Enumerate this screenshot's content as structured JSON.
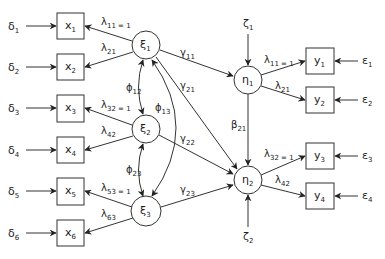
{
  "diagram": {
    "type": "structural-equation-model",
    "colors": {
      "stroke": "#333333",
      "text": "#222222",
      "background": "#ffffff"
    },
    "exogenous_indicators": [
      {
        "id": "x1",
        "label": "x",
        "sub": "1",
        "error": "δ",
        "error_sub": "1"
      },
      {
        "id": "x2",
        "label": "x",
        "sub": "2",
        "error": "δ",
        "error_sub": "2"
      },
      {
        "id": "x3",
        "label": "x",
        "sub": "3",
        "error": "δ",
        "error_sub": "3"
      },
      {
        "id": "x4",
        "label": "x",
        "sub": "4",
        "error": "δ",
        "error_sub": "4"
      },
      {
        "id": "x5",
        "label": "x",
        "sub": "5",
        "error": "δ",
        "error_sub": "5"
      },
      {
        "id": "x6",
        "label": "x",
        "sub": "6",
        "error": "δ",
        "error_sub": "6"
      }
    ],
    "exogenous_latents": [
      {
        "id": "xi1",
        "label": "ξ",
        "sub": "1"
      },
      {
        "id": "xi2",
        "label": "ξ",
        "sub": "2"
      },
      {
        "id": "xi3",
        "label": "ξ",
        "sub": "3"
      }
    ],
    "endogenous_latents": [
      {
        "id": "eta1",
        "label": "η",
        "sub": "1",
        "disturbance": "ζ",
        "disturbance_sub": "1"
      },
      {
        "id": "eta2",
        "label": "η",
        "sub": "2",
        "disturbance": "ζ",
        "disturbance_sub": "2"
      }
    ],
    "endogenous_indicators": [
      {
        "id": "y1",
        "label": "y",
        "sub": "1",
        "error": "ε",
        "error_sub": "1"
      },
      {
        "id": "y2",
        "label": "y",
        "sub": "2",
        "error": "ε",
        "error_sub": "2"
      },
      {
        "id": "y3",
        "label": "y",
        "sub": "3",
        "error": "ε",
        "error_sub": "3"
      },
      {
        "id": "y4",
        "label": "y",
        "sub": "4",
        "error": "ε",
        "error_sub": "4"
      }
    ],
    "x_loadings": [
      {
        "from": "xi1",
        "to": "x1",
        "label": "λ",
        "sub": "11 = 1"
      },
      {
        "from": "xi1",
        "to": "x2",
        "label": "λ",
        "sub": "21"
      },
      {
        "from": "xi2",
        "to": "x3",
        "label": "λ",
        "sub": "32 = 1"
      },
      {
        "from": "xi2",
        "to": "x4",
        "label": "λ",
        "sub": "42"
      },
      {
        "from": "xi3",
        "to": "x5",
        "label": "λ",
        "sub": "53 = 1"
      },
      {
        "from": "xi3",
        "to": "x6",
        "label": "λ",
        "sub": "63"
      }
    ],
    "y_loadings": [
      {
        "from": "eta1",
        "to": "y1",
        "label": "λ",
        "sub": "11 = 1"
      },
      {
        "from": "eta1",
        "to": "y2",
        "label": "λ",
        "sub": "21"
      },
      {
        "from": "eta2",
        "to": "y3",
        "label": "λ",
        "sub": "32 = 1"
      },
      {
        "from": "eta2",
        "to": "y4",
        "label": "λ",
        "sub": "42"
      }
    ],
    "gamma_paths": [
      {
        "from": "xi1",
        "to": "eta1",
        "label": "γ",
        "sub": "11"
      },
      {
        "from": "xi1",
        "to": "eta2",
        "label": "γ",
        "sub": "21"
      },
      {
        "from": "xi2",
        "to": "eta2",
        "label": "γ",
        "sub": "22"
      },
      {
        "from": "xi3",
        "to": "eta2",
        "label": "γ",
        "sub": "23"
      }
    ],
    "beta_paths": [
      {
        "from": "eta1",
        "to": "eta2",
        "label": "β",
        "sub": "21"
      }
    ],
    "covariances": [
      {
        "between": [
          "xi1",
          "xi2"
        ],
        "label": "ϕ",
        "sub": "12"
      },
      {
        "between": [
          "xi1",
          "xi3"
        ],
        "label": "ϕ",
        "sub": "13"
      },
      {
        "between": [
          "xi2",
          "xi3"
        ],
        "label": "ϕ",
        "sub": "23"
      }
    ]
  }
}
